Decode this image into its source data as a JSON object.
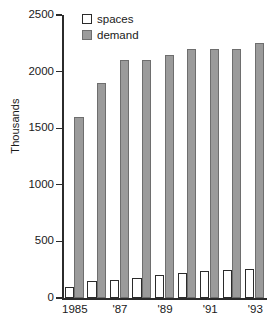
{
  "chart_data": {
    "type": "bar",
    "title": "",
    "subtitle": "",
    "xlabel": "",
    "ylabel": "Thousands",
    "ylim": [
      0,
      2500
    ],
    "yticks": [
      0,
      500,
      1000,
      1500,
      2000,
      2500
    ],
    "ytick_labels": [
      "0",
      "500",
      "1000",
      "1500",
      "2000",
      "2500"
    ],
    "grid": false,
    "legend_position": "top-left-inside",
    "categories": [
      1985,
      1986,
      1987,
      1988,
      1989,
      1990,
      1991,
      1992,
      1993
    ],
    "xtick_labels": [
      "1985",
      "",
      "'87",
      "",
      "'89",
      "",
      "'91",
      "",
      "'93"
    ],
    "series": [
      {
        "name": "spaces",
        "color": "#ffffff",
        "edge_color": "#2b2b2b",
        "values": [
          100,
          150,
          160,
          175,
          205,
          220,
          235,
          250,
          258
        ]
      },
      {
        "name": "demand",
        "color": "#9b9b9b",
        "edge_color": "#6e6e6e",
        "values": [
          1600,
          1900,
          2100,
          2100,
          2145,
          2200,
          2200,
          2200,
          2255
        ]
      }
    ],
    "legend": [
      "spaces",
      "demand"
    ]
  },
  "colors": {
    "axis": "#2b2b2b",
    "text": "#1a1a1a",
    "demand_fill": "#9b9b9b",
    "spaces_fill": "#ffffff",
    "background": "#ffffff"
  }
}
